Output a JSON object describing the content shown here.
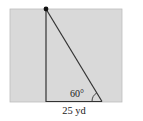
{
  "diagram": {
    "type": "right-triangle-geometry",
    "background_color": "#d9d9d9",
    "line_color": "#333333",
    "angle_label": "60°",
    "base_label": "25 yd",
    "elements": {
      "vertical_side": "pole/height (unlabeled)",
      "hypotenuse": "line from top point to base end",
      "base": "horizontal side, 25 yd",
      "angle": "60° at bottom-right vertex",
      "top_point": "filled dot at top of vertical side"
    }
  }
}
